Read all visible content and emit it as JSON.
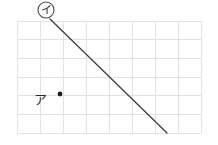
{
  "figure": {
    "background_color": "#ffffff",
    "width": 218,
    "height": 145
  },
  "grid": {
    "line_color": "#e3e3e3",
    "columns": 8,
    "rows": 6,
    "cell_width": 23,
    "cell_height": 18.7,
    "origin_x": 17,
    "origin_y": 21,
    "right_x": 201,
    "bottom_y": 133
  },
  "labels": {
    "circled": {
      "text": "イ",
      "name": "label-i",
      "circle_cx": 46,
      "circle_cy": 10,
      "circle_r": 8,
      "stroke_color": "#4a4a4a"
    },
    "plain": {
      "text": "ア",
      "name": "label-a",
      "x": 40,
      "y": 99,
      "color": "#2b2b2b"
    }
  },
  "point_marker": {
    "name": "point-a",
    "cx": 60,
    "cy": 94,
    "r": 2.4,
    "color": "#1f1f1f"
  },
  "segment": {
    "name": "diagonal-segment",
    "x1": 50,
    "y1": 19,
    "x2": 167,
    "y2": 133,
    "color": "#3a3a3a",
    "width": 1.25
  },
  "chart_data": {
    "type": "scatter",
    "title": "",
    "xlabel": "",
    "ylabel": "",
    "grid": true,
    "xlim": [
      0,
      8
    ],
    "ylim": [
      0,
      6
    ],
    "x_ticks": [
      0,
      1,
      2,
      3,
      4,
      5,
      6,
      7,
      8
    ],
    "y_ticks": [
      0,
      1,
      2,
      3,
      4,
      5,
      6
    ],
    "points": [
      {
        "label": "ア",
        "x": 2,
        "y": 2
      },
      {
        "label": "イ",
        "x": 1.4,
        "y": 6.1
      }
    ],
    "series": [
      {
        "name": "イ segment",
        "type": "line",
        "x": [
          1.4,
          6.5
        ],
        "y": [
          6.1,
          0
        ]
      }
    ],
    "legend": "none",
    "annotations": [
      {
        "text": "イ",
        "circled": true,
        "x": 1.26,
        "y": 6.6
      },
      {
        "text": "ア",
        "circled": false,
        "x": 1.0,
        "y": 2.0
      }
    ]
  }
}
